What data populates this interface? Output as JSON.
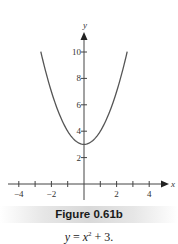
{
  "figure": {
    "title": "Figure 0.61b",
    "equation": {
      "lhs": "y",
      "eq": " = ",
      "var": "x",
      "exp": "2",
      "rest": " + 3."
    }
  },
  "colors": {
    "curve": "#555555",
    "axis": "#444444",
    "text": "#333333"
  },
  "chart_data": {
    "type": "line",
    "title": "Figure 0.61b",
    "subtitle": "y = x^2 + 3.",
    "function": "y = x^2 + 3",
    "xlabel": "x",
    "ylabel": "y",
    "x_ticks": [
      -4,
      -3,
      -2,
      -1,
      1,
      2,
      3,
      4
    ],
    "x_tick_labels": [
      "-4",
      "-2",
      "2",
      "4"
    ],
    "y_ticks": [
      2,
      4,
      6,
      8,
      10
    ],
    "y_tick_labels": [
      "2",
      "4",
      "6",
      "8",
      "10"
    ],
    "xlim": [
      -4.2,
      5
    ],
    "ylim": [
      0,
      11.5
    ],
    "grid": false,
    "legend": null,
    "series": [
      {
        "name": "y = x^2 + 3",
        "x": [
          -2.65,
          -2.5,
          -2,
          -1.5,
          -1,
          -0.5,
          0,
          0.5,
          1,
          1.5,
          2,
          2.5,
          2.65
        ],
        "y": [
          10.02,
          9.25,
          7,
          5.25,
          4,
          3.25,
          3,
          3.25,
          4,
          5.25,
          7,
          9.25,
          10.02
        ]
      }
    ]
  }
}
